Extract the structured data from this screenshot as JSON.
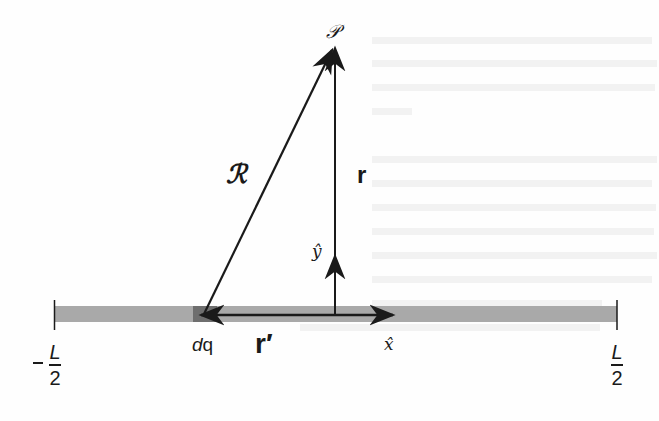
{
  "diagram": {
    "colors": {
      "line_charge": "#a9a9a9",
      "dq_segment": "#6e6e6e",
      "vectors": "#1a1a1a",
      "background": "#fefefe"
    },
    "labels": {
      "point": "𝒫",
      "script_r_vector": "ℛ",
      "r_vector": "r",
      "r_prime_vector": "r′",
      "y_hat": "ŷ",
      "x_hat": "x̂",
      "charge_element": "dq",
      "left_end": {
        "sign": "−",
        "numerator": "L",
        "denominator": "2"
      },
      "right_end": {
        "sign": "",
        "numerator": "L",
        "denominator": "2"
      }
    },
    "geometry": {
      "line_charge": {
        "x1": 54,
        "x2": 617,
        "y": 314
      },
      "origin": {
        "x": 335,
        "y": 314
      },
      "field_point": {
        "x": 335,
        "y": 50
      },
      "dq_position": {
        "x": 203,
        "y": 314
      },
      "x_hat_tip": {
        "x": 392,
        "y": 314
      },
      "y_hat_tip": {
        "x": 335,
        "y": 257
      }
    }
  }
}
